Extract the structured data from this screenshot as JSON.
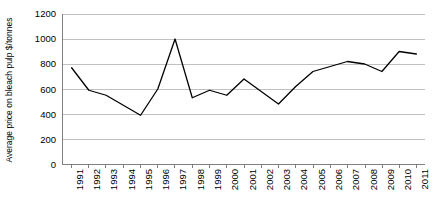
{
  "chart_data": {
    "type": "line",
    "title": "",
    "xlabel": "",
    "ylabel": "Average price on bleach pulp $/tonnes",
    "ylim": [
      0,
      1200
    ],
    "ytick_labels": [
      "1200",
      "1000",
      "800",
      "600",
      "400",
      "200",
      "0"
    ],
    "ytick_values": [
      1200,
      1000,
      800,
      600,
      400,
      200,
      0
    ],
    "grid": true,
    "grid_axis": "y",
    "legend": false,
    "legend_position": "none",
    "line_color": "#000000",
    "grid_color": "#c0c0c0",
    "axis_color": "#808080",
    "background_color": "#ffffff",
    "categories": [
      "1991",
      "1992",
      "1993",
      "1994",
      "1995",
      "1996",
      "1997",
      "1998",
      "1999",
      "2000",
      "2001",
      "2002",
      "2003",
      "2004",
      "2005",
      "2006",
      "2007",
      "2008",
      "2009",
      "2010",
      "2011"
    ],
    "values": [
      770,
      590,
      550,
      470,
      390,
      600,
      1000,
      530,
      590,
      550,
      680,
      580,
      480,
      620,
      740,
      780,
      820,
      800,
      740,
      900,
      880
    ],
    "series": [
      {
        "name": "Average price on bleach pulp $/tonnes",
        "values": [
          770,
          590,
          550,
          470,
          390,
          600,
          1000,
          530,
          590,
          550,
          680,
          580,
          480,
          620,
          740,
          780,
          820,
          800,
          740,
          900,
          880
        ]
      }
    ]
  }
}
